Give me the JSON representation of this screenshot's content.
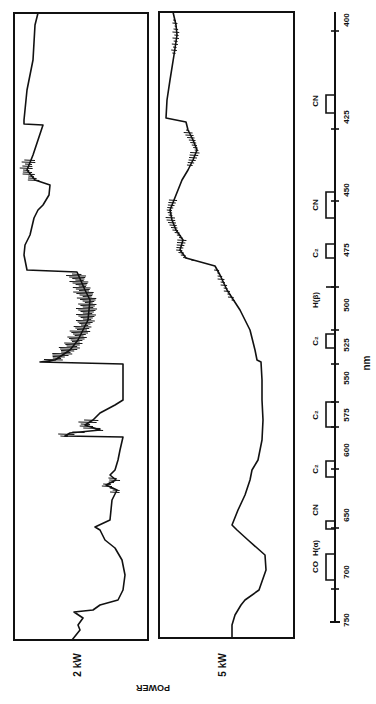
{
  "chart_data": {
    "type": "line",
    "orientation": "rotated-90 (wavelength runs top-to-bottom, power left-to-right)",
    "title": "",
    "xlabel": "nm",
    "ylabel": "POWER",
    "x_ticks": [
      400,
      425,
      450,
      475,
      500,
      525,
      550,
      575,
      600,
      650,
      700,
      750
    ],
    "xlim": [
      400,
      750
    ],
    "grid": false,
    "legend": null,
    "panels": [
      {
        "name": "2 kW",
        "power_label": "2 kW",
        "description": "Emission spectrum at 2 kW; strong C2 Swan band structure with sharp jumps near 425, 470-500, 520 and 575 nm",
        "trace_px": [
          [
            13,
            38
          ],
          [
            25,
            35
          ],
          [
            60,
            33
          ],
          [
            90,
            27
          ],
          [
            120,
            24
          ],
          [
            124,
            24
          ],
          [
            125,
            43
          ],
          [
            140,
            38
          ],
          [
            155,
            33
          ],
          [
            170,
            27
          ],
          [
            180,
            35
          ],
          [
            185,
            50
          ],
          [
            195,
            49
          ],
          [
            205,
            43
          ],
          [
            210,
            38
          ],
          [
            218,
            34
          ],
          [
            235,
            30
          ],
          [
            245,
            25
          ],
          [
            255,
            24
          ],
          [
            270,
            27
          ],
          [
            272,
            77
          ],
          [
            290,
            85
          ],
          [
            300,
            90
          ],
          [
            320,
            88
          ],
          [
            340,
            78
          ],
          [
            350,
            70
          ],
          [
            360,
            55
          ],
          [
            362,
            40
          ],
          [
            364,
            123
          ],
          [
            380,
            123
          ],
          [
            400,
            123
          ],
          [
            405,
            115
          ],
          [
            413,
            100
          ],
          [
            420,
            93
          ],
          [
            425,
            85
          ],
          [
            430,
            100
          ],
          [
            433,
            70
          ],
          [
            436,
            65
          ],
          [
            437,
            123
          ],
          [
            450,
            120
          ],
          [
            460,
            118
          ],
          [
            470,
            115
          ],
          [
            475,
            110
          ],
          [
            480,
            116
          ],
          [
            485,
            106
          ],
          [
            490,
            117
          ],
          [
            500,
            112
          ],
          [
            520,
            110
          ],
          [
            527,
            95
          ],
          [
            530,
            100
          ],
          [
            540,
            105
          ],
          [
            548,
            115
          ],
          [
            560,
            122
          ],
          [
            575,
            125
          ],
          [
            590,
            123
          ],
          [
            600,
            118
          ],
          [
            605,
            100
          ],
          [
            610,
            93
          ],
          [
            612,
            74
          ],
          [
            618,
            83
          ],
          [
            625,
            78
          ],
          [
            630,
            80
          ],
          [
            640,
            72
          ]
        ]
      },
      {
        "name": "5 kW",
        "power_label": "5 kW",
        "description": "Emission spectrum at 5 kW; smoother continuum-dominated profile",
        "trace_px": [
          [
            12,
            173
          ],
          [
            25,
            176
          ],
          [
            35,
            177
          ],
          [
            55,
            174
          ],
          [
            80,
            170
          ],
          [
            100,
            167
          ],
          [
            118,
            166
          ],
          [
            122,
            186
          ],
          [
            130,
            188
          ],
          [
            140,
            193
          ],
          [
            150,
            197
          ],
          [
            160,
            193
          ],
          [
            170,
            188
          ],
          [
            180,
            182
          ],
          [
            200,
            174
          ],
          [
            210,
            170
          ],
          [
            220,
            172
          ],
          [
            230,
            176
          ],
          [
            240,
            183
          ],
          [
            250,
            180
          ],
          [
            258,
            186
          ],
          [
            266,
            215
          ],
          [
            275,
            220
          ],
          [
            290,
            227
          ],
          [
            310,
            240
          ],
          [
            330,
            250
          ],
          [
            350,
            255
          ],
          [
            360,
            257
          ],
          [
            362,
            261
          ],
          [
            380,
            262
          ],
          [
            400,
            262
          ],
          [
            420,
            263
          ],
          [
            440,
            262
          ],
          [
            460,
            258
          ],
          [
            470,
            252
          ],
          [
            480,
            250
          ],
          [
            495,
            245
          ],
          [
            510,
            238
          ],
          [
            525,
            232
          ],
          [
            530,
            237
          ],
          [
            540,
            248
          ],
          [
            555,
            265
          ],
          [
            570,
            266
          ],
          [
            590,
            259
          ],
          [
            600,
            245
          ],
          [
            605,
            241
          ],
          [
            615,
            235
          ],
          [
            625,
            232
          ],
          [
            638,
            232
          ]
        ]
      }
    ],
    "annotations": [
      {
        "label": "CN",
        "wavelength_nm": 421
      },
      {
        "label": "CN",
        "wavelength_nm": 455
      },
      {
        "label": "C2",
        "wavelength_nm": 472
      },
      {
        "label": "H(β)",
        "wavelength_nm": 486
      },
      {
        "label": "C2",
        "wavelength_nm": 515
      },
      {
        "label": "C2",
        "wavelength_nm": 560
      },
      {
        "label": "C2",
        "wavelength_nm": 610
      },
      {
        "label": "CN",
        "wavelength_nm": 640
      },
      {
        "label": "H(α)",
        "wavelength_nm": 656
      },
      {
        "label": "CO",
        "wavelength_nm": 710
      }
    ]
  },
  "labels": {
    "power_2kw": "2 kW",
    "power_5kw": "5 kW",
    "power_axis": "POWER",
    "unit": "nm",
    "ticks": [
      "400",
      "425",
      "450",
      "475",
      "500",
      "525",
      "550",
      "575",
      "600",
      "650",
      "700",
      "750"
    ],
    "bands": [
      "CN",
      "CN",
      "C₂",
      "H(β)",
      "C₂",
      "C₂",
      "C₂",
      "CN",
      "H(α)",
      "CO"
    ]
  },
  "colors": {
    "ink": "#111111",
    "paper": "#ffffff"
  }
}
